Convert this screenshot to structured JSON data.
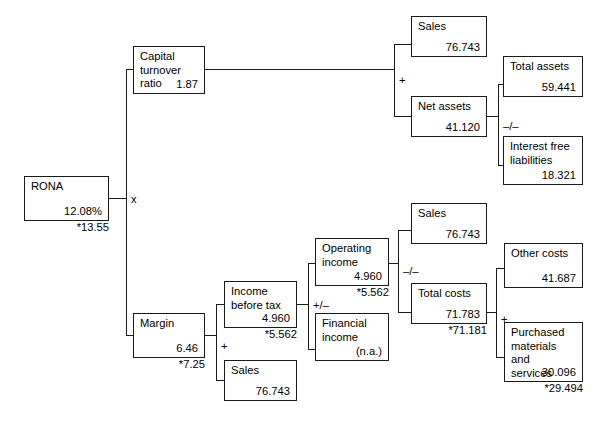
{
  "diagram": {
    "accent_color": "#1a1a1a",
    "background_color": "#ffffff"
  },
  "nodes": {
    "rona": {
      "label": "RONA",
      "value": "12.08%",
      "note": "*13.55"
    },
    "capital_turnover": {
      "label": "Capital\nturnover ratio",
      "value": "1.87",
      "note": ""
    },
    "sales_top": {
      "label": "Sales",
      "value": "76.743",
      "note": ""
    },
    "net_assets": {
      "label": "Net assets",
      "value": "41.120",
      "note": ""
    },
    "total_assets": {
      "label": "Total assets",
      "value": "59.441",
      "note": ""
    },
    "interest_free_liabilities": {
      "label": "Interest free\nliabilities",
      "value": "18.321",
      "note": ""
    },
    "margin": {
      "label": "Margin",
      "value": "6.46",
      "note": "*7.25"
    },
    "income_before_tax": {
      "label": "Income\nbefore tax",
      "value": "4.960",
      "note": "*5.562"
    },
    "sales_margin": {
      "label": "Sales",
      "value": "76.743",
      "note": ""
    },
    "operating_income": {
      "label": "Operating\nincome",
      "value": "4.960",
      "note": "*5.562"
    },
    "financial_income": {
      "label": "Financial\nincome",
      "value": "(n.a.)",
      "note": ""
    },
    "sales_mid": {
      "label": "Sales",
      "value": "76.743",
      "note": ""
    },
    "total_costs": {
      "label": "Total costs",
      "value": "71.783",
      "note": "*71.181"
    },
    "other_costs": {
      "label": "Other costs",
      "value": "41.687",
      "note": ""
    },
    "purchased_materials": {
      "label": "Purchased\nmaterials and\nservices",
      "value": "30.096",
      "note": "*29.494"
    }
  },
  "operators": {
    "rona_split": "x",
    "capital_turnover_split": "+",
    "net_assets_split": "–/–",
    "margin_split": "+",
    "income_before_tax_split": "+/–",
    "operating_income_split": "–/–",
    "total_costs_split": "+"
  }
}
